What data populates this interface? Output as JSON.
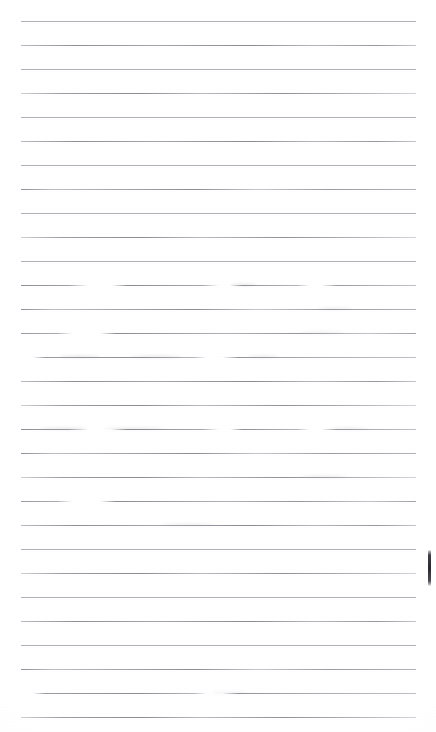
{
  "document": {
    "type": "scanned-blank-ruled-notebook-page",
    "title": "",
    "body_text": "",
    "page_number": "",
    "visible_text_content": [],
    "background_color": "#fefefe",
    "rule_color": "#9a9aa4",
    "mark_color": "#2e2e34",
    "width_px": 436,
    "height_px": 732
  },
  "ruling": {
    "line_count": 29,
    "first_line_y": 21,
    "line_spacing_px": 24,
    "line_left_x": 21,
    "line_right_x": 416,
    "line_thickness_px": 1,
    "lines": [
      {
        "y": 21,
        "style": "soft",
        "left": 21,
        "right": 416
      },
      {
        "y": 45,
        "style": "grad-a",
        "left": 21,
        "right": 416
      },
      {
        "y": 69,
        "style": "soft",
        "left": 21,
        "right": 416
      },
      {
        "y": 93,
        "style": "grad-b",
        "left": 21,
        "right": 416
      },
      {
        "y": 117,
        "style": "soft",
        "left": 21,
        "right": 416
      },
      {
        "y": 141,
        "style": "grad-a",
        "left": 21,
        "right": 416
      },
      {
        "y": 165,
        "style": "soft",
        "left": 21,
        "right": 416
      },
      {
        "y": 189,
        "style": "grad-c",
        "left": 21,
        "right": 416
      },
      {
        "y": 213,
        "style": "soft",
        "left": 21,
        "right": 416
      },
      {
        "y": 237,
        "style": "grad-b",
        "left": 21,
        "right": 416
      },
      {
        "y": 261,
        "style": "soft",
        "left": 21,
        "right": 416
      },
      {
        "y": 285,
        "style": "broken-a",
        "left": 21,
        "right": 416
      },
      {
        "y": 309,
        "style": "grad-c",
        "left": 21,
        "right": 416
      },
      {
        "y": 333,
        "style": "broken-b",
        "left": 21,
        "right": 416
      },
      {
        "y": 357,
        "style": "broken-c",
        "left": 21,
        "right": 416
      },
      {
        "y": 381,
        "style": "grad-a",
        "left": 21,
        "right": 416
      },
      {
        "y": 405,
        "style": "grad-b",
        "left": 21,
        "right": 416
      },
      {
        "y": 429,
        "style": "broken-a",
        "left": 21,
        "right": 416
      },
      {
        "y": 453,
        "style": "grad-c",
        "left": 21,
        "right": 416
      },
      {
        "y": 477,
        "style": "grad-b",
        "left": 21,
        "right": 416
      },
      {
        "y": 501,
        "style": "broken-b",
        "left": 21,
        "right": 416
      },
      {
        "y": 525,
        "style": "grad-a",
        "left": 21,
        "right": 416
      },
      {
        "y": 549,
        "style": "soft",
        "left": 21,
        "right": 416
      },
      {
        "y": 573,
        "style": "grad-b",
        "left": 21,
        "right": 416
      },
      {
        "y": 597,
        "style": "soft",
        "left": 21,
        "right": 416
      },
      {
        "y": 621,
        "style": "grad-a",
        "left": 21,
        "right": 416
      },
      {
        "y": 645,
        "style": "soft",
        "left": 21,
        "right": 416
      },
      {
        "y": 669,
        "style": "grad-c",
        "left": 21,
        "right": 416
      },
      {
        "y": 693,
        "style": "broken-c",
        "left": 21,
        "right": 416
      },
      {
        "y": 717,
        "style": "grad-b",
        "left": 21,
        "right": 416
      }
    ]
  },
  "artifacts": {
    "smudges": [
      {
        "x": 230,
        "y": 284,
        "width": 26,
        "opacity": 0.3
      },
      {
        "x": 318,
        "y": 308,
        "width": 34,
        "opacity": 0.24
      },
      {
        "x": 60,
        "y": 356,
        "width": 40,
        "opacity": 0.34
      },
      {
        "x": 130,
        "y": 356,
        "width": 52,
        "opacity": 0.28
      },
      {
        "x": 248,
        "y": 356,
        "width": 30,
        "opacity": 0.26
      },
      {
        "x": 300,
        "y": 332,
        "width": 44,
        "opacity": 0.22
      },
      {
        "x": 40,
        "y": 428,
        "width": 46,
        "opacity": 0.33
      },
      {
        "x": 104,
        "y": 428,
        "width": 60,
        "opacity": 0.27
      },
      {
        "x": 330,
        "y": 428,
        "width": 38,
        "opacity": 0.25
      },
      {
        "x": 300,
        "y": 476,
        "width": 48,
        "opacity": 0.23
      },
      {
        "x": 160,
        "y": 524,
        "width": 54,
        "opacity": 0.21
      },
      {
        "x": 212,
        "y": 692,
        "width": 36,
        "opacity": 0.2
      }
    ],
    "edge_mark": {
      "name": "edge-tick-mark",
      "x": 428,
      "y": 550,
      "width": 3,
      "height": 36,
      "color": "#2e2e34"
    }
  }
}
